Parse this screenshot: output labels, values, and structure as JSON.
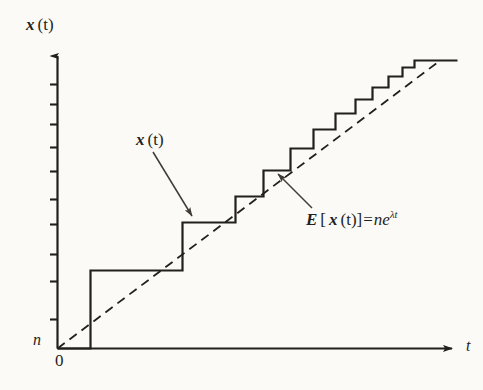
{
  "figure": {
    "background_color": "#fbfaf6",
    "ink_color": "#231f1c",
    "axes": {
      "y_axis_caption_var": "x",
      "y_axis_caption_arg": "(t)",
      "y_axis_origin_label": "n",
      "x_axis_origin_label": "0",
      "x_axis_label": "t",
      "y_tick_count": 10
    },
    "annotations": {
      "sample_path": {
        "var": "x",
        "arg": "(t)",
        "full_text": "x (t)"
      },
      "mean_curve": {
        "operator": "E",
        "bracket_open": "[",
        "var": "x",
        "arg": "(t)",
        "bracket_close": "]",
        "equals": "=",
        "rhs_coefficient": "n",
        "rhs_base": "e",
        "rhs_exponent": "λt",
        "full_text": "E [ x (t) ] = ne^λt"
      }
    }
  },
  "chart_data": {
    "type": "line",
    "title": "",
    "xlabel": "t",
    "ylabel": "x (t)",
    "grid": false,
    "legend": "none",
    "xlim": [
      0,
      420
    ],
    "ylim": [
      0,
      300
    ],
    "series": [
      {
        "name": "x (t)",
        "kind": "step",
        "style": "solid",
        "color": "#231f1c",
        "line_width": 2.2,
        "step_jump_times": [
          33,
          125,
          178,
          206,
          233,
          256,
          278,
          298,
          315,
          331,
          345,
          357
        ],
        "step_levels": [
          0,
          78,
          126,
          152,
          178,
          200,
          219,
          235,
          249,
          261,
          272,
          281,
          288
        ],
        "end_time": 400
      },
      {
        "name": "E [x (t)] = ne^λt",
        "kind": "line",
        "style": "dashed",
        "color": "#231f1c",
        "line_width": 1.8,
        "dash_pattern": [
          9,
          6
        ],
        "x": [
          0,
          380
        ],
        "y": [
          0,
          286
        ]
      }
    ],
    "y_ticks_pixel_offsets": [
      28,
      48,
      68,
      91,
      115,
      143,
      168,
      198,
      225,
      263
    ]
  }
}
